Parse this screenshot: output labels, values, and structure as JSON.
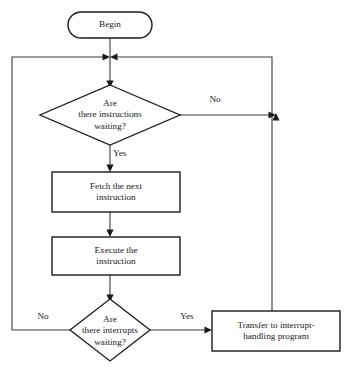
{
  "diagram": {
    "type": "flowchart",
    "colors": {
      "background": "#ffffff",
      "stroke": "#1a1a1a",
      "connector": "#3a3a3a",
      "text": "#1a1a1a"
    },
    "nodes": [
      {
        "id": "begin",
        "shape": "terminator",
        "label": "Begin",
        "lines": [
          "Begin"
        ]
      },
      {
        "id": "instructions-decision",
        "shape": "decision",
        "label": "Are there instructions waiting?",
        "lines": [
          "Are",
          "there instructions",
          "waiting?"
        ]
      },
      {
        "id": "fetch",
        "shape": "process",
        "label": "Fetch the next instruction",
        "lines": [
          "Fetch the next",
          "instruction"
        ]
      },
      {
        "id": "execute",
        "shape": "process",
        "label": "Execute the instruction",
        "lines": [
          "Execute the",
          "instruction"
        ]
      },
      {
        "id": "interrupts-decision",
        "shape": "decision",
        "label": "Are there interrupts waiting?",
        "lines": [
          "Are",
          "there interrupts",
          "waiting?"
        ]
      },
      {
        "id": "transfer",
        "shape": "process",
        "label": "Transfer to interrupt-handling program",
        "lines": [
          "Transfer to interrupt-",
          "handling program"
        ]
      }
    ],
    "edge_labels": {
      "instructions_no": "No",
      "instructions_yes": "Yes",
      "interrupts_no": "No",
      "interrupts_yes": "Yes"
    }
  }
}
